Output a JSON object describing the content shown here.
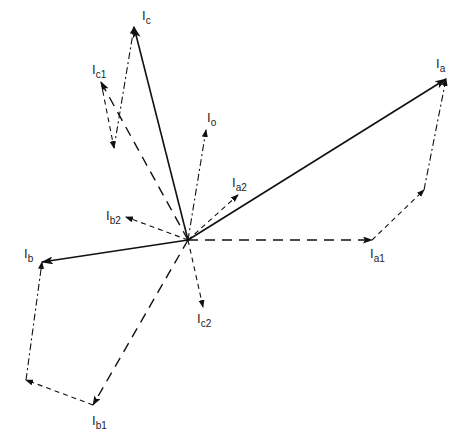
{
  "diagram": {
    "type": "phasor-diagram",
    "origin": [
      188,
      240
    ],
    "phasors": [
      {
        "id": "Ia",
        "label_main": "I",
        "label_sub": "a",
        "style": "solid",
        "tip": [
          446,
          79
        ],
        "label_pos": [
          436,
          68
        ]
      },
      {
        "id": "Ib",
        "label_main": "I",
        "label_sub": "b",
        "style": "solid",
        "tip": [
          42,
          262
        ],
        "label_pos": [
          24,
          258
        ]
      },
      {
        "id": "Ic",
        "label_main": "I",
        "label_sub": "c",
        "style": "solid",
        "tip": [
          134,
          27
        ],
        "label_pos": [
          142,
          20
        ]
      },
      {
        "id": "Ia1",
        "label_main": "I",
        "label_sub": "a1",
        "style": "dash-long",
        "tip": [
          372,
          240
        ],
        "label_pos": [
          370,
          258
        ]
      },
      {
        "id": "Ib1",
        "label_main": "I",
        "label_sub": "b1",
        "style": "dash-long",
        "tip": [
          93,
          405
        ],
        "label_pos": [
          92,
          425
        ]
      },
      {
        "id": "Ic1",
        "label_main": "I",
        "label_sub": "c1",
        "style": "dash-long",
        "tip": [
          101,
          82
        ],
        "label_pos": [
          92,
          74
        ]
      },
      {
        "id": "Ia2",
        "label_main": "I",
        "label_sub": "a2",
        "style": "dash-short",
        "tip": [
          238,
          195
        ],
        "label_pos": [
          232,
          187
        ]
      },
      {
        "id": "Ib2",
        "label_main": "I",
        "label_sub": "b2",
        "style": "dash-short",
        "tip": [
          126,
          217
        ],
        "label_pos": [
          106,
          220
        ]
      },
      {
        "id": "Ic2",
        "label_main": "I",
        "label_sub": "c2",
        "style": "dash-short",
        "tip": [
          203,
          307
        ],
        "label_pos": [
          197,
          323
        ]
      },
      {
        "id": "Io",
        "label_main": "I",
        "label_sub": "o",
        "style": "dash-dot",
        "tip": [
          206,
          130
        ],
        "label_pos": [
          207,
          122
        ]
      }
    ],
    "construction_lines": [
      {
        "from": [
          372,
          240
        ],
        "via": [
          424,
          190
        ],
        "to": [
          446,
          79
        ]
      },
      {
        "from": [
          93,
          405
        ],
        "via": [
          26,
          380
        ],
        "to": [
          42,
          262
        ]
      },
      {
        "from": [
          101,
          82
        ],
        "via": [
          114,
          148
        ],
        "to": [
          134,
          27
        ]
      }
    ],
    "labels": {
      "Ia": {
        "main": "I",
        "sub": "a"
      },
      "Ib": {
        "main": "I",
        "sub": "b"
      },
      "Ic": {
        "main": "I",
        "sub": "c"
      },
      "Ia1": {
        "main": "I",
        "sub": "a1"
      },
      "Ib1": {
        "main": "I",
        "sub": "b1"
      },
      "Ic1": {
        "main": "I",
        "sub": "c1"
      },
      "Ia2": {
        "main": "I",
        "sub": "a2"
      },
      "Ib2": {
        "main": "I",
        "sub": "b2"
      },
      "Ic2": {
        "main": "I",
        "sub": "c2"
      },
      "Io": {
        "main": "I",
        "sub": "o"
      }
    },
    "colors": {
      "line": "#111111",
      "background": "#ffffff",
      "text": "#222222"
    }
  }
}
